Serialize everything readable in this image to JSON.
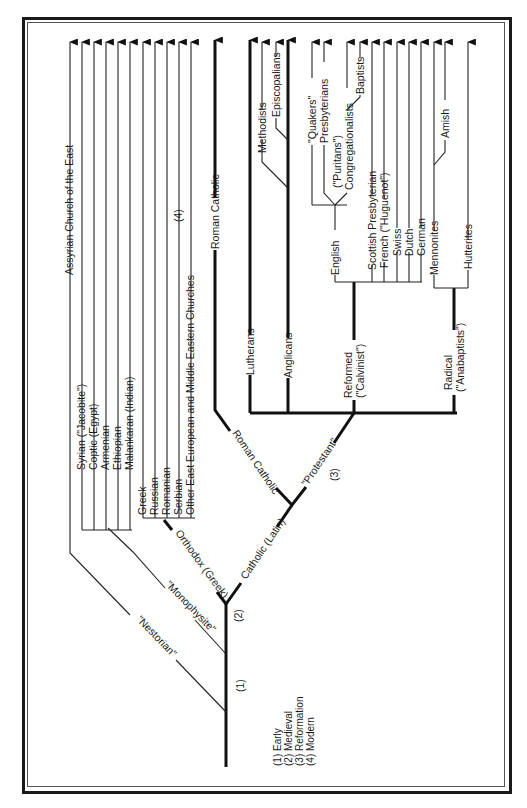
{
  "diagram": {
    "orientation": "rotated-90-ccw",
    "branches": {
      "nestorian": "\"Nestorian\"",
      "monophysite": "\"Monophysite\"",
      "orthodox": "Orthodox (Greek)",
      "catholic": "Catholic (Latin)",
      "roman_catholic_branch": "Roman Catholic",
      "protestant": "\"Protestant\""
    },
    "period_markers": {
      "p1": "(1)",
      "p2": "(2)",
      "p3": "(3)",
      "p4": "(4)"
    },
    "eastern": {
      "assyrian": "Assyrian Church of the East",
      "syrian": "Syrian (\"Jacobite\")",
      "coptic": "Coptic (Egypt)",
      "armenian": "Armenian",
      "ethiopian": "Ethiopian",
      "malankaran": "Malankaran (Indian)",
      "greek": "Greek",
      "russian": "Russian",
      "romanian": "Romanian",
      "serbian": "Serbian",
      "other_east": "Other East European and Middle Eastern Churches"
    },
    "western": {
      "roman_catholic": "Roman Catholic",
      "lutherans": "Lutherans",
      "anglicans": "Anglicans",
      "methodists": "Methodists",
      "episcopalians": "Episcopalians",
      "reformed_1": "Reformed",
      "reformed_2": "(\"Calvinist\")",
      "english": "English",
      "quakers": "\"Quakers\"",
      "presbyterians": "Presbyterians",
      "puritans": "(\"Puritans\")",
      "congregationalists": "Congregationalists",
      "baptists": "Baptists",
      "scottish": "Scottish Presbyterian",
      "french": "French (\"Huguenot\")",
      "swiss": "Swiss",
      "dutch": "Dutch",
      "german": "German",
      "radical_1": "Radical",
      "radical_2": "(\"Anabaptists\")",
      "mennonites": "Mennonites",
      "amish": "Amish",
      "hutterites": "Hutterites"
    },
    "legend": {
      "l1": "(1) Early",
      "l2": "(2) Medieval",
      "l3": "(3) Reformation",
      "l4": "(4) Modern"
    }
  }
}
